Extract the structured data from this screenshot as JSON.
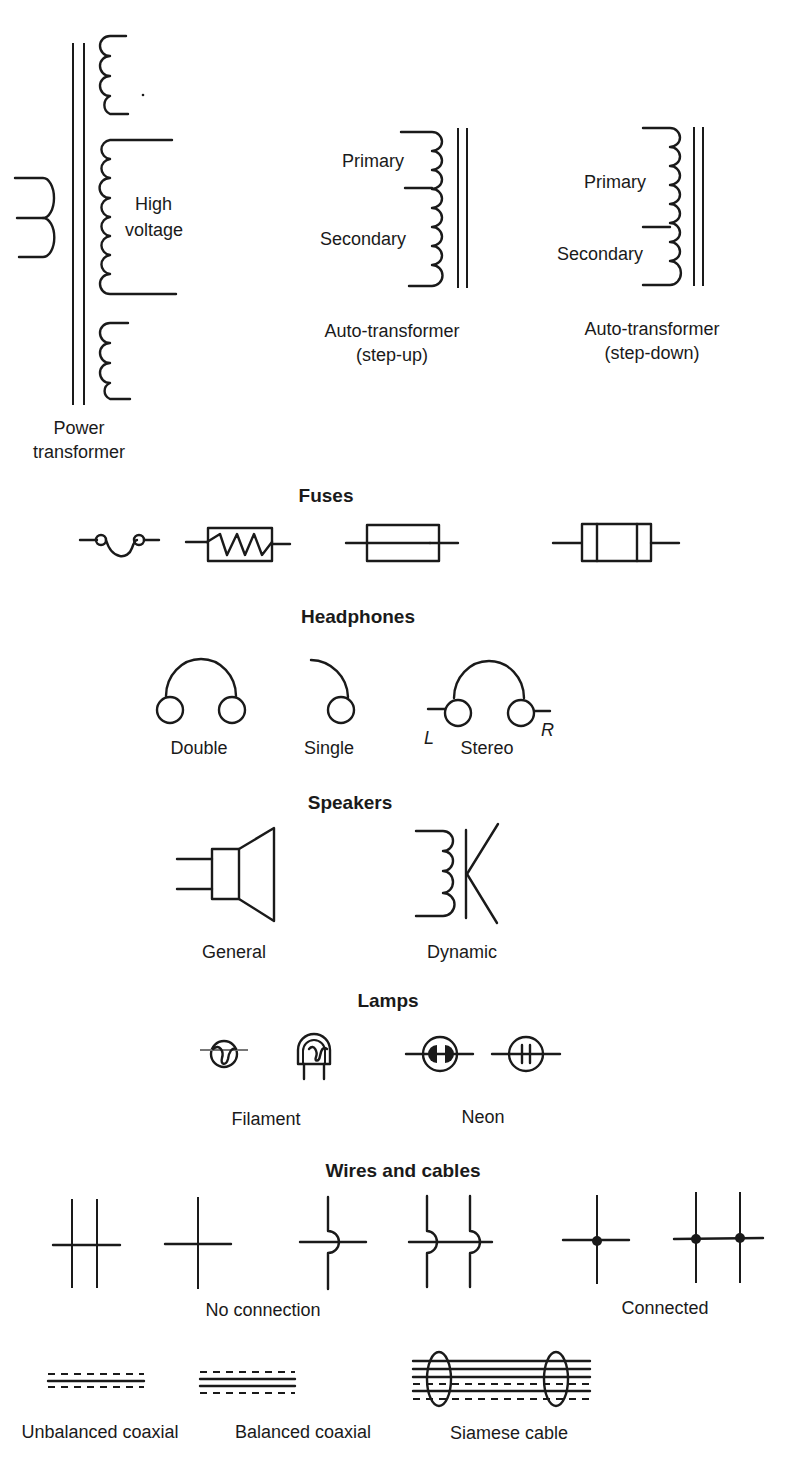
{
  "transformers": {
    "power": {
      "label_line1": "Power",
      "label_line2": "transformer",
      "winding_label_line1": "High",
      "winding_label_line2": "voltage"
    },
    "auto_step_up": {
      "primary": "Primary",
      "secondary": "Secondary",
      "label_line1": "Auto-transformer",
      "label_line2": "(step-up)"
    },
    "auto_step_down": {
      "primary": "Primary",
      "secondary": "Secondary",
      "label_line1": "Auto-transformer",
      "label_line2": "(step-down)"
    }
  },
  "fuses": {
    "heading": "Fuses",
    "symbols": [
      "wire-loop-fuse",
      "zigzag-box-fuse",
      "line-through-box-fuse",
      "cartridge-fuse"
    ]
  },
  "headphones": {
    "heading": "Headphones",
    "items": [
      {
        "label": "Double"
      },
      {
        "label": "Single"
      },
      {
        "label": "Stereo",
        "left_marker": "L",
        "right_marker": "R"
      }
    ]
  },
  "speakers": {
    "heading": "Speakers",
    "items": [
      {
        "label": "General"
      },
      {
        "label": "Dynamic"
      }
    ]
  },
  "lamps": {
    "heading": "Lamps",
    "groups": [
      {
        "label": "Filament"
      },
      {
        "label": "Neon"
      }
    ]
  },
  "wires": {
    "heading": "Wires and cables",
    "no_connection_label": "No connection",
    "connected_label": "Connected",
    "cables": [
      {
        "label": "Unbalanced coaxial"
      },
      {
        "label": "Balanced coaxial"
      },
      {
        "label": "Siamese cable"
      }
    ]
  }
}
